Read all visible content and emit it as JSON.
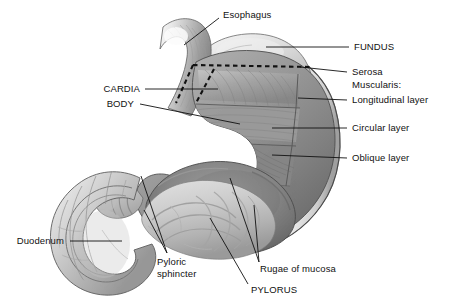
{
  "figure": {
    "type": "anatomical-illustration",
    "style": "grayscale-cutaway",
    "background_color": "#ffffff",
    "line_color": "#111111"
  },
  "labels": {
    "esophagus": "Esophagus",
    "fundus": "FUNDUS",
    "serosa": "Serosa",
    "muscularis": "Muscularis:",
    "longitudinal_layer": "Longitudinal layer",
    "circular_layer": "Circular layer",
    "oblique_layer": "Oblique layer",
    "cardia": "CARDIA",
    "body": "BODY",
    "duodenum": "Duodenum",
    "pyloric_sphincter_line1": "Pyloric",
    "pyloric_sphincter_line2": "sphincter",
    "rugae": "Rugae of mucosa",
    "pylorus": "PYLORUS"
  },
  "palette": {
    "outline": "#2b2b2b",
    "serosa_light": "#e3e3e3",
    "serosa_mid": "#c9c9c9",
    "muscle_light": "#c2c2c2",
    "muscle_mid": "#9d9d9d",
    "muscle_dark": "#6f6f6f",
    "lumen_dark": "#7a7a7a",
    "mucosa_light": "#d4d4d4",
    "highlight": "#f2f2f2",
    "shadow": "#555555"
  }
}
